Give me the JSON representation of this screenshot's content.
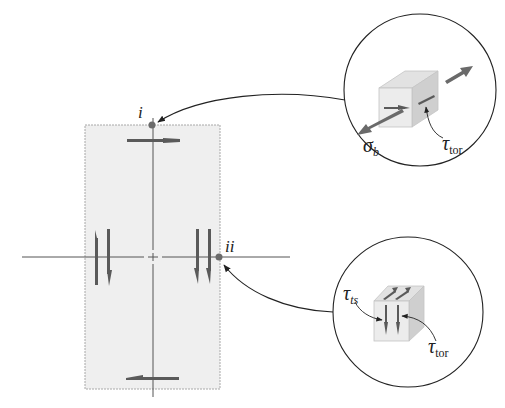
{
  "diagram": {
    "type": "stress-element-diagram",
    "points": [
      {
        "id": "i",
        "label": "i"
      },
      {
        "id": "ii",
        "label": "ii"
      }
    ],
    "callouts": [
      {
        "id": "top-element",
        "point": "i",
        "labels": {
          "sigma": {
            "symbol": "σ",
            "subscript": "b"
          },
          "tau": {
            "symbol": "τ",
            "subscript": "tor"
          }
        }
      },
      {
        "id": "bottom-element",
        "point": "ii",
        "labels": {
          "tau_ts": {
            "symbol": "τ",
            "subscript": "ts"
          },
          "tau_tor": {
            "symbol": "τ",
            "subscript": "tor"
          }
        }
      }
    ],
    "colors": {
      "section_fill": "#efefef",
      "section_border": "#a8a8a8",
      "axis": "#555555",
      "arrow": "#5a5a5a",
      "point": "#6b6b6b",
      "cube_front": "#ececec",
      "cube_side": "#cfcfcf",
      "cube_top": "#e2e2e2",
      "circle_stroke": "#222222"
    }
  }
}
